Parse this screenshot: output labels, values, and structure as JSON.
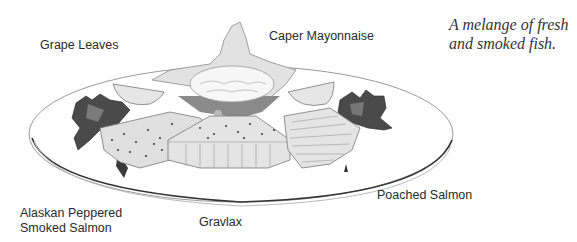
{
  "caption": {
    "line1": "A melange of fresh",
    "line2": "and smoked fish."
  },
  "labels": {
    "grape_leaves": "Grape Leaves",
    "caper_mayonnaise": "Caper Mayonnaise",
    "alaskan_line1": "Alaskan Peppered",
    "alaskan_line2": "Smoked Salmon",
    "gravlax": "Gravlax",
    "poached_salmon": "Poached Salmon"
  },
  "colors": {
    "plate_outline": "#555555",
    "grape_leaf_dark": "#4a4a4a",
    "fish_light": "#d8d8d8",
    "bowl_leaf": "#e2e2e2",
    "text": "#2a2a2a"
  }
}
